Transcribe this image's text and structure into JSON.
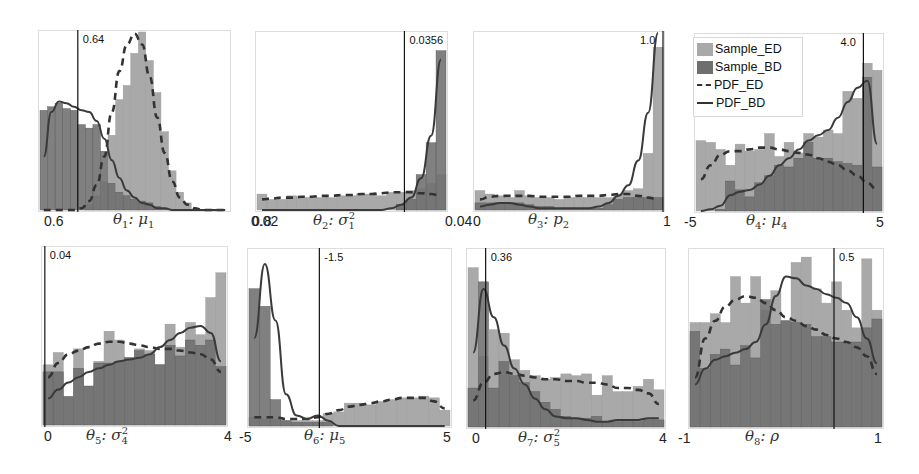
{
  "colors": {
    "sample_ed": "#a9a9a9",
    "sample_bd": "#6e6e6e",
    "overlap": "#5a5a5a",
    "pdf_ed": "#333333",
    "pdf_bd": "#3a3a3a",
    "true_line": "#111111",
    "frame": "#dddddd"
  },
  "legend": {
    "items": [
      {
        "label": "Sample_ED",
        "kind": "patch-light"
      },
      {
        "label": "Sample_BD",
        "kind": "patch-dark"
      },
      {
        "label": "PDF_ED",
        "kind": "dashed-line"
      },
      {
        "label": "PDF_BD",
        "kind": "solid-line"
      }
    ]
  },
  "chart_data": [
    {
      "type": "bar",
      "title": "",
      "xlabel": "θ1: μ1",
      "x_tick_labels": [
        "0.6",
        "0.8"
      ],
      "xlim": [
        0.6,
        0.8
      ],
      "true_value": 0.64,
      "true_value_label": "0.64",
      "series": [
        {
          "name": "Sample_ED",
          "values": [
            0,
            0,
            0,
            0,
            0,
            0,
            0.03,
            0.08,
            0.16,
            0.42,
            0.62,
            0.7,
            0.88,
            1.0,
            0.84,
            0.66,
            0.44,
            0.22,
            0.1,
            0.04,
            0,
            0,
            0,
            0,
            0
          ]
        },
        {
          "name": "Sample_BD",
          "values": [
            0.56,
            0.58,
            0.6,
            0.57,
            0.56,
            0.48,
            0.46,
            0.48,
            0.33,
            0.15,
            0.1,
            0.08,
            0.06,
            0.05,
            0.04,
            0.02,
            0.01,
            0,
            0,
            0,
            0,
            0,
            0,
            0,
            0
          ]
        },
        {
          "name": "PDF_ED",
          "values": [
            0,
            0,
            0,
            0,
            0,
            0.01,
            0.05,
            0.14,
            0.3,
            0.55,
            0.78,
            0.93,
            0.99,
            0.93,
            0.75,
            0.52,
            0.32,
            0.16,
            0.07,
            0.03,
            0.01,
            0,
            0,
            0,
            0
          ]
        },
        {
          "name": "PDF_BD",
          "values": [
            0.3,
            0.55,
            0.61,
            0.6,
            0.58,
            0.56,
            0.55,
            0.5,
            0.4,
            0.28,
            0.18,
            0.11,
            0.07,
            0.04,
            0.03,
            0.01,
            0.01,
            0,
            0,
            0,
            0,
            0,
            0,
            0,
            0
          ]
        }
      ]
    },
    {
      "type": "bar",
      "xlabel": "θ2: σ1²",
      "x_tick_labels": [
        "0.02",
        "0.04"
      ],
      "xlim": [
        0.02,
        0.04
      ],
      "true_value": 0.0356,
      "true_value_label": "0.0356",
      "series": [
        {
          "name": "Sample_ED",
          "values": [
            0.09,
            0.06,
            0.06,
            0.08,
            0.07,
            0.07,
            0.07,
            0.07,
            0.08,
            0.08,
            0.09,
            0.09,
            0.08,
            0.1,
            0.1,
            0.11,
            0.12,
            0.15,
            0.2
          ]
        },
        {
          "name": "Sample_BD",
          "values": [
            0,
            0,
            0,
            0,
            0,
            0,
            0,
            0,
            0,
            0,
            0,
            0,
            0,
            0,
            0.03,
            0.06,
            0.2,
            0.38,
            0.9
          ]
        },
        {
          "name": "PDF_ED",
          "values": [
            0.06,
            0.065,
            0.07,
            0.07,
            0.075,
            0.075,
            0.08,
            0.08,
            0.085,
            0.085,
            0.09,
            0.09,
            0.095,
            0.1,
            0.1,
            0.1,
            0.095,
            0.09,
            0.08
          ]
        },
        {
          "name": "PDF_BD",
          "values": [
            0,
            0,
            0,
            0,
            0,
            0,
            0,
            0,
            0,
            0,
            0,
            0,
            0,
            0.01,
            0.03,
            0.07,
            0.18,
            0.42,
            0.85
          ]
        }
      ]
    },
    {
      "type": "bar",
      "xlabel": "θ3: p2",
      "x_tick_labels": [
        "0",
        "1"
      ],
      "xlim": [
        0,
        1
      ],
      "true_value": 1.0,
      "true_value_label": "1.0",
      "series": [
        {
          "name": "Sample_ED",
          "values": [
            0.11,
            0.09,
            0.08,
            0.07,
            0.11,
            0.08,
            0.07,
            0.07,
            0.06,
            0.07,
            0.07,
            0.07,
            0.07,
            0.07,
            0.09,
            0.11,
            0.12,
            0.32,
            0.92
          ]
        },
        {
          "name": "Sample_BD",
          "values": [
            0.04,
            0.04,
            0.04,
            0.04,
            0.04,
            0.03,
            0.02,
            0.02,
            0.01,
            0.01,
            0.01,
            0.01,
            0.01,
            0.03,
            0.06,
            0.07,
            0.07,
            0.07,
            0.07
          ]
        },
        {
          "name": "PDF_ED",
          "values": [
            0.06,
            0.075,
            0.08,
            0.08,
            0.08,
            0.08,
            0.075,
            0.075,
            0.075,
            0.075,
            0.08,
            0.08,
            0.08,
            0.085,
            0.09,
            0.09,
            0.08,
            0.07,
            0.06
          ]
        },
        {
          "name": "PDF_BD",
          "values": [
            0.02,
            0.03,
            0.04,
            0.04,
            0.03,
            0.02,
            0.01,
            0.01,
            0.01,
            0.01,
            0.01,
            0.01,
            0.02,
            0.04,
            0.08,
            0.14,
            0.28,
            0.55,
            1.0
          ]
        }
      ]
    },
    {
      "type": "bar",
      "xlabel": "θ4: μ4",
      "x_tick_labels": [
        "-5",
        "5"
      ],
      "xlim": [
        -5,
        5
      ],
      "true_value": 4.0,
      "true_value_label": "4.0",
      "series": [
        {
          "name": "Sample_ED",
          "values": [
            0.4,
            0.39,
            0.35,
            0.26,
            0.38,
            0.34,
            0.35,
            0.44,
            0.31,
            0.39,
            0.33,
            0.44,
            0.42,
            0.46,
            0.44,
            0.68,
            0.64,
            0.84,
            0.8
          ]
        },
        {
          "name": "Sample_BD",
          "values": [
            0,
            0,
            0.01,
            0.17,
            0.12,
            0.08,
            0.16,
            0.2,
            0.26,
            0.25,
            0.3,
            0.39,
            0.3,
            0.3,
            0.28,
            0.27,
            0.26,
            0.76,
            0.25
          ]
        },
        {
          "name": "PDF_ED",
          "values": [
            0.18,
            0.26,
            0.32,
            0.34,
            0.34,
            0.35,
            0.36,
            0.36,
            0.35,
            0.34,
            0.33,
            0.32,
            0.3,
            0.28,
            0.26,
            0.23,
            0.2,
            0.16,
            0.12
          ]
        },
        {
          "name": "PDF_BD",
          "values": [
            0,
            0.01,
            0.03,
            0.09,
            0.11,
            0.12,
            0.15,
            0.2,
            0.26,
            0.3,
            0.35,
            0.4,
            0.43,
            0.46,
            0.53,
            0.62,
            0.7,
            0.74,
            0.38
          ]
        }
      ]
    },
    {
      "type": "bar",
      "xlabel": "θ5: σ4²",
      "x_tick_labels": [
        "0",
        "4"
      ],
      "xlim": [
        0,
        4
      ],
      "true_value": 0.04,
      "true_value_label": "0.04",
      "series": [
        {
          "name": "Sample_ED",
          "values": [
            0.34,
            0.41,
            0.16,
            0.43,
            0.22,
            0.36,
            0.53,
            0.48,
            0.38,
            0.43,
            0.42,
            0.34,
            0.57,
            0.44,
            0.58,
            0.51,
            0.72,
            0.86
          ]
        },
        {
          "name": "Sample_BD",
          "values": [
            0.3,
            0.3,
            0.16,
            0.32,
            0.22,
            0.35,
            0.35,
            0.36,
            0.38,
            0.42,
            0.4,
            0.34,
            0.45,
            0.39,
            0.48,
            0.45,
            0.48,
            0.33
          ]
        },
        {
          "name": "PDF_ED",
          "values": [
            0.27,
            0.35,
            0.4,
            0.42,
            0.44,
            0.46,
            0.47,
            0.47,
            0.46,
            0.45,
            0.44,
            0.43,
            0.43,
            0.42,
            0.41,
            0.4,
            0.37,
            0.3
          ]
        },
        {
          "name": "PDF_BD",
          "values": [
            0.15,
            0.2,
            0.24,
            0.27,
            0.3,
            0.32,
            0.34,
            0.36,
            0.37,
            0.38,
            0.4,
            0.44,
            0.48,
            0.52,
            0.55,
            0.56,
            0.52,
            0.36
          ]
        }
      ]
    },
    {
      "type": "bar",
      "xlabel": "θ6: μ5",
      "x_tick_labels": [
        "-5",
        "5"
      ],
      "xlim": [
        -5,
        5
      ],
      "true_value": -1.5,
      "true_value_label": "-1.5",
      "series": [
        {
          "name": "Sample_ED",
          "values": [
            0.05,
            0.04,
            0.04,
            0.03,
            0.03,
            0.03,
            0.03,
            0.07,
            0.08,
            0.13,
            0.13,
            0.12,
            0.14,
            0.15,
            0.16,
            0.16,
            0.17,
            0.16,
            0.09
          ]
        },
        {
          "name": "Sample_BD",
          "values": [
            0.78,
            0.68,
            0.15,
            0.03,
            0.02,
            0.02,
            0.02,
            0.02,
            0,
            0,
            0,
            0,
            0,
            0,
            0,
            0,
            0,
            0,
            0
          ]
        },
        {
          "name": "PDF_ED",
          "values": [
            0.05,
            0.05,
            0.05,
            0.04,
            0.04,
            0.04,
            0.05,
            0.07,
            0.09,
            0.11,
            0.12,
            0.13,
            0.14,
            0.15,
            0.16,
            0.16,
            0.16,
            0.14,
            0.1
          ]
        },
        {
          "name": "PDF_BD",
          "values": [
            0.5,
            0.92,
            0.6,
            0.18,
            0.06,
            0.04,
            0.06,
            0.03,
            0,
            0,
            0,
            0,
            0,
            0,
            0,
            0,
            0,
            0,
            0
          ]
        }
      ]
    },
    {
      "type": "bar",
      "xlabel": "θ7: σ5²",
      "x_tick_labels": [
        "0",
        "4"
      ],
      "xlim": [
        0,
        4
      ],
      "true_value": 0.36,
      "true_value_label": "0.36",
      "series": [
        {
          "name": "Sample_ED",
          "values": [
            0.9,
            0.4,
            0.55,
            0.53,
            0.38,
            0.32,
            0.29,
            0.27,
            0.28,
            0.3,
            0.29,
            0.3,
            0.18,
            0.29,
            0.2,
            0.2,
            0.23,
            0.27,
            0.21
          ]
        },
        {
          "name": "Sample_BD",
          "values": [
            0.22,
            0.82,
            0.22,
            0.37,
            0.29,
            0.25,
            0.2,
            0.14,
            0.1,
            0.06,
            0.05,
            0.05,
            0.06,
            0.03,
            0.03,
            0.03,
            0.03,
            0.04,
            0.04
          ]
        },
        {
          "name": "PDF_ED",
          "values": [
            0.15,
            0.25,
            0.3,
            0.31,
            0.3,
            0.29,
            0.28,
            0.27,
            0.27,
            0.26,
            0.26,
            0.25,
            0.25,
            0.24,
            0.22,
            0.22,
            0.21,
            0.19,
            0.13
          ]
        },
        {
          "name": "PDF_BD",
          "values": [
            0.42,
            0.78,
            0.62,
            0.46,
            0.33,
            0.24,
            0.16,
            0.1,
            0.06,
            0.05,
            0.05,
            0.04,
            0.03,
            0.03,
            0.04,
            0.04,
            0.04,
            0.05,
            0.05
          ]
        }
      ]
    },
    {
      "type": "bar",
      "xlabel": "θ8: ρ",
      "x_tick_labels": [
        "-1",
        "1"
      ],
      "xlim": [
        -1,
        1
      ],
      "true_value": 0.5,
      "true_value_label": "0.5",
      "series": [
        {
          "name": "Sample_ED",
          "values": [
            0.59,
            0.59,
            0.64,
            0.59,
            0.85,
            0.7,
            0.85,
            0.66,
            0.77,
            0.6,
            0.93,
            0.96,
            0.78,
            0.7,
            0.82,
            0.66,
            0.56,
            0.95,
            0.66
          ]
        },
        {
          "name": "Sample_BD",
          "values": [
            0.54,
            0.33,
            0.41,
            0.44,
            0.35,
            0.46,
            0.39,
            0.72,
            0.58,
            0.6,
            0.59,
            0.58,
            0.51,
            0.51,
            0.48,
            0.48,
            0.48,
            0.56,
            0.61
          ]
        },
        {
          "name": "PDF_ED",
          "values": [
            0.28,
            0.5,
            0.6,
            0.68,
            0.72,
            0.74,
            0.73,
            0.7,
            0.66,
            0.62,
            0.6,
            0.57,
            0.55,
            0.52,
            0.5,
            0.48,
            0.45,
            0.4,
            0.3
          ]
        },
        {
          "name": "PDF_BD",
          "values": [
            0.24,
            0.33,
            0.38,
            0.4,
            0.42,
            0.44,
            0.48,
            0.58,
            0.74,
            0.85,
            0.84,
            0.8,
            0.78,
            0.75,
            0.73,
            0.7,
            0.62,
            0.5,
            0.36
          ]
        }
      ]
    }
  ],
  "panels": [
    {
      "xlabel_main": "θ",
      "xlabel_sub": "1",
      "xlabel_rest": ": μ",
      "xlabel_sub2": "1",
      "xlabel_sup2": ""
    },
    {
      "xlabel_main": "θ",
      "xlabel_sub": "2",
      "xlabel_rest": ": σ",
      "xlabel_sub2": "1",
      "xlabel_sup2": "2"
    },
    {
      "xlabel_main": "θ",
      "xlabel_sub": "3",
      "xlabel_rest": ": p",
      "xlabel_sub2": "2",
      "xlabel_sup2": ""
    },
    {
      "xlabel_main": "θ",
      "xlabel_sub": "4",
      "xlabel_rest": ": μ",
      "xlabel_sub2": "4",
      "xlabel_sup2": ""
    },
    {
      "xlabel_main": "θ",
      "xlabel_sub": "5",
      "xlabel_rest": ": σ",
      "xlabel_sub2": "4",
      "xlabel_sup2": "2"
    },
    {
      "xlabel_main": "θ",
      "xlabel_sub": "6",
      "xlabel_rest": ": μ",
      "xlabel_sub2": "5",
      "xlabel_sup2": ""
    },
    {
      "xlabel_main": "θ",
      "xlabel_sub": "7",
      "xlabel_rest": ": σ",
      "xlabel_sub2": "5",
      "xlabel_sup2": "2"
    },
    {
      "xlabel_main": "θ",
      "xlabel_sub": "8",
      "xlabel_rest": ": ρ",
      "xlabel_sub2": "",
      "xlabel_sup2": ""
    }
  ]
}
